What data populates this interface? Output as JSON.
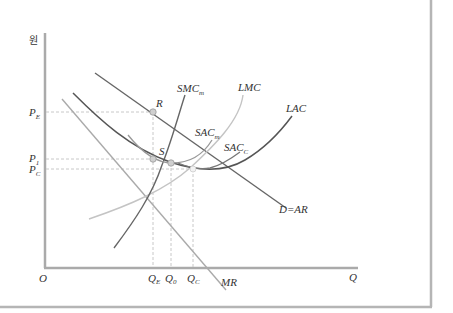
{
  "diagram": {
    "y_axis_label": "원",
    "x_axis_label": "Q",
    "origin_label": "O",
    "price_labels": {
      "pe": {
        "main": "P",
        "sub": "E"
      },
      "p1": {
        "main": "P",
        "sub": "1"
      },
      "pc": {
        "main": "P",
        "sub": "C"
      }
    },
    "quantity_labels": {
      "qe": {
        "main": "Q",
        "sub": "E"
      },
      "q0": {
        "main": "Q",
        "sub": "0"
      },
      "qc": {
        "main": "Q",
        "sub": "C"
      }
    },
    "curve_labels": {
      "smc": {
        "main": "SMC",
        "sub": "m"
      },
      "lmc": {
        "main": "LMC",
        "sub": ""
      },
      "lac": {
        "main": "LAC",
        "sub": ""
      },
      "sacm": {
        "main": "SAC",
        "sub": "m"
      },
      "sacc": {
        "main": "SAC",
        "sub": "C"
      },
      "demand": {
        "main": "D=AR",
        "sub": ""
      },
      "mr": {
        "main": "MR",
        "sub": ""
      }
    },
    "point_labels": {
      "r": "R",
      "s": "S"
    },
    "colors": {
      "axis": "#aaaaaa",
      "frame": "#b5b5b5",
      "dark_curve": "#555555",
      "light_curve": "#bbbbbb",
      "mid_curve": "#999999",
      "dashed": "#c8c8c8",
      "point_fill": "#cfcfcf"
    }
  }
}
